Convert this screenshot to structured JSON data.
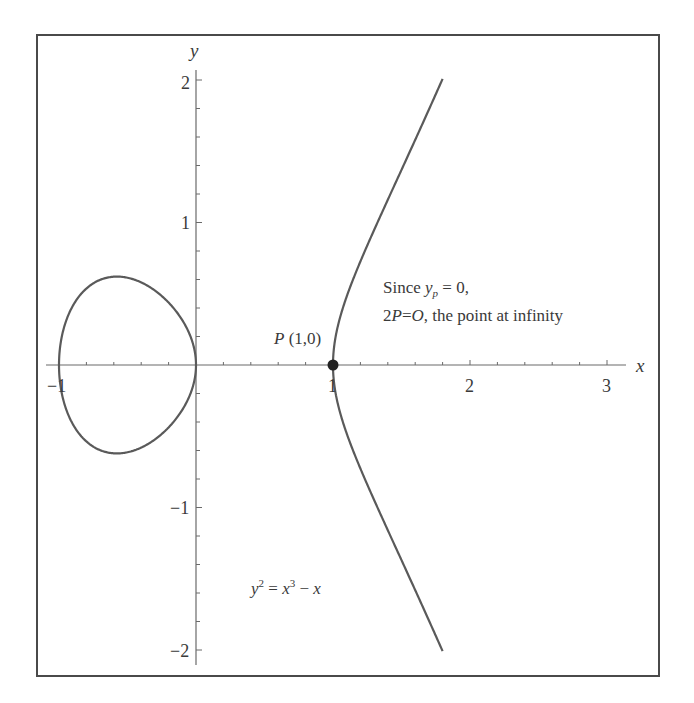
{
  "chart_data": {
    "type": "line",
    "title": "",
    "equation": "y^2 = x^3 - x",
    "xlabel": "x",
    "ylabel": "y",
    "xlim": [
      -1.05,
      3.05
    ],
    "ylim": [
      -2.1,
      2.1
    ],
    "x_ticks": [
      -1,
      1,
      2,
      3
    ],
    "x_tick_labels": [
      "−1",
      "1",
      "2",
      "3"
    ],
    "y_ticks": [
      -2,
      -1,
      1,
      2
    ],
    "y_tick_labels": [
      "−2",
      "−1",
      "1",
      "2"
    ],
    "minor_tick_step": 0.2,
    "grid": false,
    "legend": null,
    "series": [
      {
        "name": "y^2 = x^3 - x (closed loop)",
        "x_range": [
          -1,
          0
        ],
        "points": [
          [
            -1,
            0
          ],
          [
            -0.8,
            0.379
          ],
          [
            -0.577,
            0.62
          ],
          [
            -0.4,
            0.58
          ],
          [
            -0.2,
            0.438
          ],
          [
            0,
            0
          ],
          [
            -0.2,
            -0.438
          ],
          [
            -0.4,
            -0.58
          ],
          [
            -0.577,
            -0.62
          ],
          [
            -0.8,
            -0.379
          ],
          [
            -1,
            0
          ]
        ]
      },
      {
        "name": "y^2 = x^3 - x (unbounded branch)",
        "x_range": [
          1,
          1.8
        ],
        "points": [
          [
            1.8,
            2.008
          ],
          [
            1.6,
            1.661
          ],
          [
            1.4,
            1.166
          ],
          [
            1.2,
            0.812
          ],
          [
            1.05,
            0.322
          ],
          [
            1,
            0
          ],
          [
            1.05,
            -0.322
          ],
          [
            1.2,
            -0.812
          ],
          [
            1.4,
            -1.166
          ],
          [
            1.6,
            -1.661
          ],
          [
            1.8,
            -2.008
          ]
        ]
      }
    ],
    "highlighted_point": {
      "label": "P (1,0)",
      "x": 1,
      "y": 0
    },
    "annotations": [
      "P (1,0)",
      "Since y_p = 0,",
      "2P=O, the point at infinity",
      "y^2 = x^3 - x"
    ]
  },
  "labels": {
    "x_axis": "x",
    "y_axis": "y",
    "x_tick_neg1": "−1",
    "x_tick_1": "1",
    "x_tick_2": "2",
    "x_tick_3": "3",
    "y_tick_2": "2",
    "y_tick_1": "1",
    "y_tick_neg1": "−1",
    "y_tick_neg2": "−2",
    "point_P_letter": "P",
    "point_P_coords": " (1,0)",
    "since_prefix": "Since ",
    "since_var": "y",
    "since_sub": "p",
    "since_suffix": " = 0,",
    "result_2": "2",
    "result_P": "P",
    "result_eq": "=",
    "result_O": "O",
    "result_rest": ", the point at infinity",
    "eq_y": "y",
    "eq_y_exp": "2",
    "eq_mid": " = ",
    "eq_x": "x",
    "eq_x_exp": "3",
    "eq_minus": " − ",
    "eq_x2": "x"
  },
  "colors": {
    "curve": "#5a5a5a",
    "axes": "#6a6a6a",
    "frame": "#4a4a4a",
    "text": "#3a3a3a",
    "point": "#222222"
  }
}
